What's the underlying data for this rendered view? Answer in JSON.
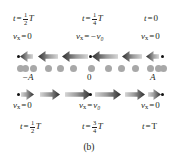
{
  "figure": {
    "caption": "(b)",
    "background_color": "#ffffff",
    "text_color": "#231f20",
    "arrow_color_dark": "#2b2b2b",
    "arrow_color_light": "#d6d6d6",
    "medium_dot_color": "#a8a8a8",
    "particle_dot_color": "#111111"
  },
  "top_time_labels": [
    {
      "id": "t-half-T-top",
      "text": "t = ½T",
      "lhs": "t",
      "rel": "=",
      "num": "1",
      "den": "2",
      "rhs": "T",
      "x_pct": 17
    },
    {
      "id": "t-quarter-T-top",
      "text": "t = ¼T",
      "lhs": "t",
      "rel": "=",
      "num": "1",
      "den": "4",
      "rhs": "T",
      "x_pct": 53
    },
    {
      "id": "t-zero-top",
      "text": "t = 0",
      "lhs": "t",
      "rel": "=",
      "num": "",
      "den": "",
      "rhs": "0",
      "x_pct": 86
    }
  ],
  "top_velocity_labels": [
    {
      "id": "vx-zero-top-left",
      "var": "v",
      "sub": "x",
      "rel": "=",
      "value": "0",
      "x_pct": 16
    },
    {
      "id": "vx-neg-v0-top-mid",
      "var": "v",
      "sub": "x",
      "rel": "=",
      "value": "−v₀",
      "x_pct": 53
    },
    {
      "id": "vx-zero-top-right",
      "var": "v",
      "sub": "x",
      "rel": "=",
      "value": "0",
      "x_pct": 86
    }
  ],
  "bottom_velocity_labels": [
    {
      "id": "vx-zero-bot-left",
      "var": "v",
      "sub": "x",
      "rel": "=",
      "value": "0",
      "x_pct": 16
    },
    {
      "id": "vx-v0-bot-mid",
      "var": "v",
      "sub": "x",
      "rel": "=",
      "value": "v₀",
      "x_pct": 53
    },
    {
      "id": "vx-zero-bot-right",
      "var": "v",
      "sub": "x",
      "rel": "=",
      "value": "0",
      "x_pct": 86
    }
  ],
  "bottom_time_labels": [
    {
      "id": "t-half-T-bottom",
      "text": "t = ½T",
      "lhs": "t",
      "rel": "=",
      "num": "1",
      "den": "2",
      "rhs": "T",
      "x_pct": 17
    },
    {
      "id": "t-three-quarter-T-bottom",
      "text": "t = ¾T",
      "lhs": "t",
      "rel": "=",
      "num": "3",
      "den": "4",
      "rhs": "T",
      "x_pct": 53
    },
    {
      "id": "t-T-bottom",
      "text": "t = T",
      "lhs": "t",
      "rel": "=",
      "num": "",
      "den": "",
      "rhs": "T",
      "x_pct": 86
    }
  ],
  "position_labels": [
    {
      "id": "pos-minus-A",
      "text": "−A",
      "x_pct": 16
    },
    {
      "id": "pos-zero",
      "text": "0",
      "x_pct": 50
    },
    {
      "id": "pos-plus-A",
      "text": "A",
      "x_pct": 85
    }
  ],
  "top_arrow_row": {
    "direction": "left",
    "arrows": [
      {
        "x": 20,
        "len": 13
      },
      {
        "x": 38,
        "len": 20
      },
      {
        "x": 62,
        "len": 26
      },
      {
        "x": 92,
        "len": 26
      },
      {
        "x": 122,
        "len": 20
      },
      {
        "x": 146,
        "len": 13
      }
    ],
    "dots": [
      {
        "x": 17
      },
      {
        "x": 89
      },
      {
        "x": 161
      }
    ]
  },
  "bottom_arrow_row": {
    "direction": "right",
    "arrows": [
      {
        "x": 21,
        "len": 13
      },
      {
        "x": 40,
        "len": 20
      },
      {
        "x": 65,
        "len": 26
      },
      {
        "x": 95,
        "len": 26
      },
      {
        "x": 125,
        "len": 20
      },
      {
        "x": 148,
        "len": 13
      }
    ],
    "dots": [
      {
        "x": 17
      },
      {
        "x": 89
      },
      {
        "x": 161
      }
    ]
  },
  "medium_dot_row": {
    "count": 13,
    "dots": [
      {
        "x": 17
      },
      {
        "x": 22
      },
      {
        "x": 30
      },
      {
        "x": 45
      },
      {
        "x": 57
      },
      {
        "x": 70
      },
      {
        "x": 88
      },
      {
        "x": 105
      },
      {
        "x": 118
      },
      {
        "x": 132
      },
      {
        "x": 147
      },
      {
        "x": 155
      },
      {
        "x": 160
      }
    ]
  }
}
